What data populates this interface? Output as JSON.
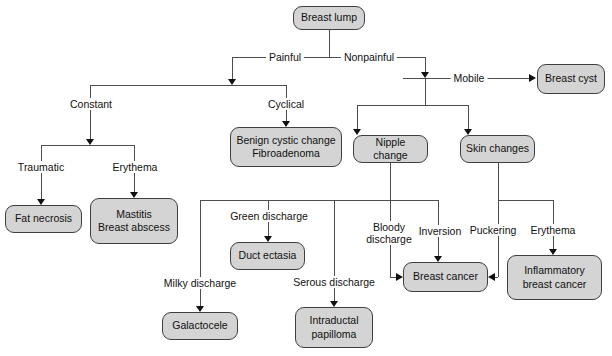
{
  "diagram_type": "flowchart",
  "topic": "Breast lump differential diagnosis",
  "colors": {
    "node_fill": "#d4d4d4",
    "node_border": "#3f3f3f",
    "connector": "#4d4d4d",
    "text": "#111111",
    "background": "#ffffff"
  },
  "nodes": {
    "breast_lump": "Breast lump",
    "breast_cyst": "Breast cyst",
    "benign_cystic_change": "Benign cystic change\nFibroadenoma",
    "nipple_change": "Nipple change",
    "skin_changes": "Skin changes",
    "fat_necrosis": "Fat necrosis",
    "mastitis_breast_abscess": "Mastitis\nBreast abscess",
    "duct_ectasia": "Duct ectasia",
    "galactocele": "Galactocele",
    "intraductal_papilloma": "Intraductal\npapilloma",
    "breast_cancer": "Breast cancer",
    "inflammatory_breast_cancer": "Inflammatory\nbreast cancer"
  },
  "edge_labels": {
    "painful": "Painful",
    "nonpainful": "Nonpainful",
    "mobile": "Mobile",
    "constant": "Constant",
    "cyclical": "Cyclical",
    "traumatic": "Traumatic",
    "erythema_left": "Erythema",
    "green_discharge": "Green discharge",
    "milky_discharge": "Milky discharge",
    "serous_discharge": "Serous discharge",
    "bloody_discharge": "Bloody\ndischarge",
    "inversion": "Inversion",
    "puckering": "Puckering",
    "erythema_right": "Erythema"
  }
}
